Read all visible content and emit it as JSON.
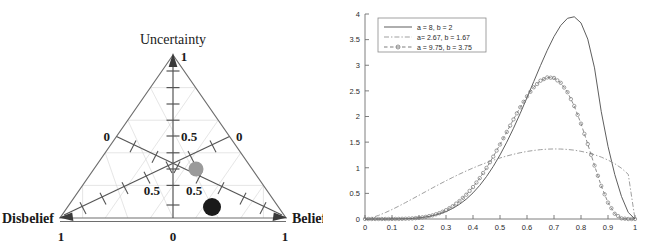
{
  "figure": {
    "panels": [
      {
        "id": "ternary-opinion-triangle",
        "type": "ternary",
        "vertices": {
          "top_label": "Uncertainty",
          "top_value": "1",
          "left_label": "Disbelief",
          "left_value": "1",
          "right_label": "Belief",
          "right_value": "1",
          "bottom_center_value": "0"
        },
        "axis_labels": {
          "left_zero": "0",
          "right_zero": "0",
          "center_half": "0.5",
          "left_half": "0.5",
          "right_half": "0.5"
        },
        "points": [
          {
            "name": "gray-opinion-point",
            "belief": 0.34,
            "disbelief": 0.37,
            "uncertainty": 0.29,
            "color": "#9a9a9a",
            "radius": 7.5,
            "px": 196,
            "py": 169
          },
          {
            "name": "black-opinion-point",
            "belief": 0.47,
            "disbelief": 0.46,
            "uncertainty": 0.07,
            "color": "#1a1a1a",
            "radius": 9,
            "px": 212,
            "py": 207
          }
        ]
      }
    ]
  },
  "chart_data": {
    "type": "line",
    "title": "",
    "xlabel": "",
    "ylabel": "",
    "xlim": [
      0,
      1
    ],
    "ylim": [
      0,
      4
    ],
    "grid": false,
    "legend_position": "top-left",
    "xticks": [
      "0",
      "0.1",
      "0.2",
      "0.3",
      "0.4",
      "0.5",
      "0.6",
      "0.7",
      "0.8",
      "0.9",
      "1"
    ],
    "xtick_values": [
      0,
      0.1,
      0.2,
      0.3,
      0.4,
      0.5,
      0.6,
      0.7,
      0.8,
      0.9,
      1
    ],
    "yticks": [
      "0",
      "0.5",
      "1",
      "1.5",
      "2",
      "2.5",
      "3",
      "3.5",
      "4"
    ],
    "ytick_values": [
      0,
      0.5,
      1,
      1.5,
      2,
      2.5,
      3,
      3.5,
      4
    ],
    "x": [
      0,
      0.025,
      0.05,
      0.075,
      0.1,
      0.125,
      0.15,
      0.175,
      0.2,
      0.225,
      0.25,
      0.275,
      0.3,
      0.325,
      0.35,
      0.375,
      0.4,
      0.425,
      0.45,
      0.475,
      0.5,
      0.525,
      0.55,
      0.575,
      0.6,
      0.625,
      0.65,
      0.675,
      0.7,
      0.725,
      0.75,
      0.775,
      0.8,
      0.825,
      0.85,
      0.875,
      0.9,
      0.925,
      0.95,
      0.975,
      1
    ],
    "series": [
      {
        "name": "a = 8, b = 2",
        "style": "solid",
        "color": "#555555",
        "marker": "none",
        "peak_x": 0.875,
        "peak_y": 3.52,
        "values": [
          0,
          0,
          0,
          0,
          0.001,
          0.003,
          0.006,
          0.012,
          0.023,
          0.039,
          0.064,
          0.098,
          0.145,
          0.207,
          0.287,
          0.387,
          0.51,
          0.656,
          0.828,
          1.026,
          1.25,
          1.499,
          1.771,
          2.062,
          2.368,
          2.682,
          2.994,
          3.292,
          3.56,
          3.777,
          3.916,
          3.946,
          3.826,
          3.51,
          2.949,
          2.094,
          1.417,
          0.869,
          0.439,
          0.128,
          0
        ]
      },
      {
        "name": "a= 2.67, b = 1.67",
        "style": "dashdot",
        "color": "#9a9a9a",
        "marker": "none",
        "peak_x": 0.715,
        "peak_y": 1.68,
        "values": [
          0,
          0.026,
          0.07,
          0.124,
          0.185,
          0.251,
          0.32,
          0.391,
          0.463,
          0.535,
          0.607,
          0.677,
          0.746,
          0.812,
          0.876,
          0.937,
          0.995,
          1.049,
          1.1,
          1.147,
          1.19,
          1.229,
          1.263,
          1.293,
          1.318,
          1.338,
          1.353,
          1.363,
          1.367,
          1.365,
          1.357,
          1.343,
          1.321,
          1.292,
          1.255,
          1.208,
          1.15,
          1.079,
          0.99,
          0.872,
          0
        ]
      },
      {
        "name": "a = 9.75, b = 3.75",
        "style": "dashed",
        "color": "#777777",
        "marker": "circle",
        "peak_x": 0.76,
        "peak_y": 3.35,
        "values": [
          0,
          0,
          0,
          0,
          0.001,
          0.002,
          0.005,
          0.011,
          0.023,
          0.042,
          0.071,
          0.113,
          0.172,
          0.25,
          0.35,
          0.474,
          0.623,
          0.798,
          0.997,
          1.217,
          1.453,
          1.699,
          1.944,
          2.18,
          2.393,
          2.57,
          2.698,
          2.762,
          2.752,
          2.657,
          2.474,
          2.204,
          1.86,
          1.462,
          1.043,
          0.645,
          0.32,
          0.102,
          0.012,
          0,
          0
        ]
      }
    ]
  }
}
